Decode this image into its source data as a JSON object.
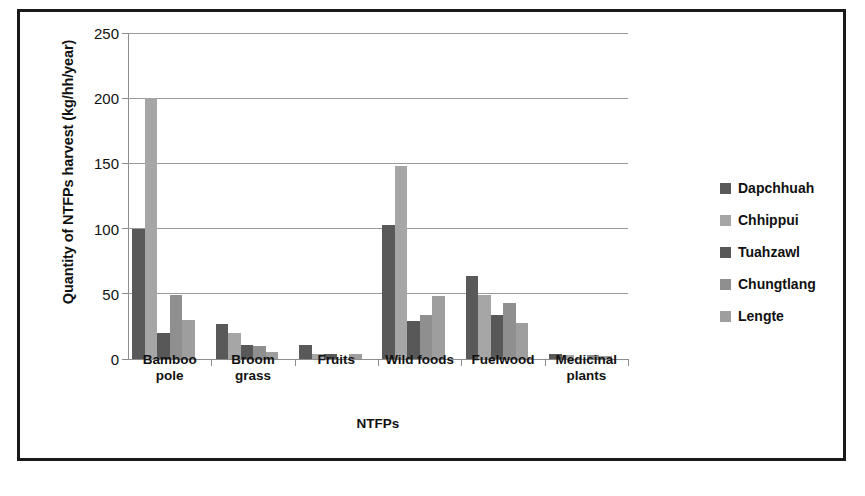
{
  "chart_data": {
    "type": "bar",
    "title": "",
    "xlabel": "NTFPs",
    "ylabel": "Quantity of NTFPs harvest (kg/hh/year)",
    "ylim": [
      0,
      250
    ],
    "yticks": [
      0,
      50,
      100,
      150,
      200,
      250
    ],
    "ytick_labels": [
      "0",
      "50",
      "100",
      "150",
      "200",
      "250"
    ],
    "grid": true,
    "legend_position": "right",
    "categories": [
      "Bamboo pole",
      "Broom grass",
      "Fruits",
      "Wild foods",
      "Fuelwood",
      "Medicinal plants"
    ],
    "category_lines": [
      [
        "Bamboo",
        "pole"
      ],
      [
        "Broom",
        "grass"
      ],
      [
        "Fruits"
      ],
      [
        "Wild foods"
      ],
      [
        "Fuelwood"
      ],
      [
        "Medicinal",
        "plants"
      ]
    ],
    "series": [
      {
        "name": "Dapchhuah",
        "color": "#595959",
        "values": [
          100,
          27,
          11,
          103,
          64,
          4
        ]
      },
      {
        "name": "Chhippui",
        "color": "#a6a6a6",
        "values": [
          200,
          20,
          4,
          148,
          49,
          3
        ]
      },
      {
        "name": "Tuahzawl",
        "color": "#585858",
        "values": [
          20,
          11,
          4,
          29,
          34,
          0
        ]
      },
      {
        "name": "Chungtlang",
        "color": "#8f8f8f",
        "values": [
          49,
          10,
          0,
          34,
          43,
          3
        ]
      },
      {
        "name": "Lengte",
        "color": "#9e9e9e",
        "values": [
          30,
          5,
          4,
          48,
          28,
          2
        ]
      }
    ]
  }
}
